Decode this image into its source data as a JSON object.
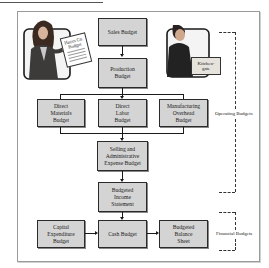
{
  "diagram": {
    "illustrations": {
      "left_person_sign": "Hayes Co.\nBudget",
      "right_person_box": "Kitchen-\ngate"
    },
    "nodes": {
      "sales_budget": "Sales Budget",
      "production_budget": "Production\nBudget",
      "direct_materials_budget": "Direct\nMaterials\nBudget",
      "direct_labor_budget": "Direct\nLabor\nBudget",
      "manufacturing_overhead_budget": "Manufacturing\nOverhead\nBudget",
      "selling_admin_expense_budget": "Selling and\nAdministrative\nExpense Budget",
      "budgeted_income_statement": "Budgeted\nIncome\nStatement",
      "capital_expenditure_budget": "Capital\nExpenditure\nBudget",
      "cash_budget": "Cash Budget",
      "budgeted_balance_sheet": "Budgeted\nBalance\nSheet"
    },
    "groups": {
      "operating": "Operating Budgets",
      "financial": "Financial Budgets"
    },
    "edges": [
      [
        "Sales Budget",
        "Production Budget"
      ],
      [
        "Production Budget",
        "Direct Materials Budget"
      ],
      [
        "Production Budget",
        "Direct Labor Budget"
      ],
      [
        "Production Budget",
        "Manufacturing Overhead Budget"
      ],
      [
        "Direct Materials Budget",
        "Selling and Administrative Expense Budget"
      ],
      [
        "Direct Labor Budget",
        "Selling and Administrative Expense Budget"
      ],
      [
        "Manufacturing Overhead Budget",
        "Selling and Administrative Expense Budget"
      ],
      [
        "Selling and Administrative Expense Budget",
        "Budgeted Income Statement"
      ],
      [
        "Budgeted Income Statement",
        "Cash Budget"
      ],
      [
        "Capital Expenditure Budget",
        "Cash Budget"
      ],
      [
        "Cash Budget",
        "Budgeted Balance Sheet"
      ]
    ],
    "colors": {
      "box_fill": "#d4d4d4",
      "box_border": "#2a2a2a",
      "frame_border": "#9a9a9a"
    }
  }
}
